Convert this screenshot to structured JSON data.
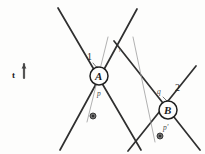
{
  "figure": {
    "background": "#fdfdfc",
    "ink": "#2b2b2b",
    "ink_light": "#9a9a9a",
    "nodes": [
      {
        "id": "A",
        "label": "A",
        "cx": 99,
        "cy": 76,
        "r": 9
      },
      {
        "id": "B",
        "label": "B",
        "cx": 168,
        "cy": 110,
        "r": 9
      }
    ],
    "labels": {
      "line_1": "1",
      "line_2": "2",
      "p": "p",
      "p_prime": "p'",
      "q": "q",
      "r": "r",
      "t": "t"
    },
    "markers": [
      {
        "id": "marker-left",
        "cx": 93,
        "cy": 116,
        "r": 3
      },
      {
        "id": "marker-right",
        "cx": 160,
        "cy": 136,
        "r": 3
      }
    ],
    "lines": [
      {
        "id": "line-a-down-right",
        "x1": 58,
        "y1": 8,
        "x2": 141,
        "y2": 150,
        "w": 1.7,
        "color": "#2f2f2f"
      },
      {
        "id": "line-a-down-left",
        "x1": 137,
        "y1": 9,
        "x2": 60,
        "y2": 150,
        "w": 1.7,
        "color": "#2f2f2f"
      },
      {
        "id": "line-b-down-right",
        "x1": 114,
        "y1": 41,
        "x2": 200,
        "y2": 150,
        "w": 1.7,
        "color": "#2f2f2f"
      },
      {
        "id": "line-b-down-left",
        "x1": 196,
        "y1": 66,
        "x2": 128,
        "y2": 151,
        "w": 1.7,
        "color": "#2f2f2f"
      },
      {
        "id": "line-thin-p",
        "x1": 108,
        "y1": 37,
        "x2": 87,
        "y2": 122,
        "w": 0.8,
        "color": "#9d9d9d"
      },
      {
        "id": "line-thin-q",
        "x1": 133,
        "y1": 37,
        "x2": 155,
        "y2": 142,
        "w": 0.8,
        "color": "#9d9d9d"
      }
    ],
    "arrows": [
      {
        "id": "arrow-q-to-b",
        "x1": 163,
        "y1": 97,
        "x2": 169,
        "y2": 103
      },
      {
        "id": "arrow-1-to-a",
        "x1": 93,
        "y1": 63,
        "x2": 98,
        "y2": 69
      },
      {
        "id": "arrow-t",
        "x1": 24,
        "y1": 78,
        "x2": 24,
        "y2": 64
      }
    ]
  }
}
